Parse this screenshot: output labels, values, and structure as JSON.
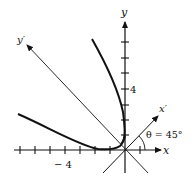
{
  "diagram": {
    "type": "rotation-of-axes",
    "labels": {
      "x_axis": "x",
      "y_axis": "y",
      "x_prime": "x′",
      "y_prime": "y′",
      "angle": "θ = 45°",
      "x_tick_label": "− 4",
      "y_tick_label": "4"
    },
    "axes": {
      "x_ticks": [
        -7,
        -6,
        -5,
        -4,
        -3,
        -2,
        -1,
        1
      ],
      "y_ticks": [
        1,
        2,
        3,
        4,
        5,
        6,
        7
      ],
      "rotation_angle_deg": 45
    },
    "colors": {
      "ink": "#111111",
      "background": "#ffffff"
    }
  }
}
